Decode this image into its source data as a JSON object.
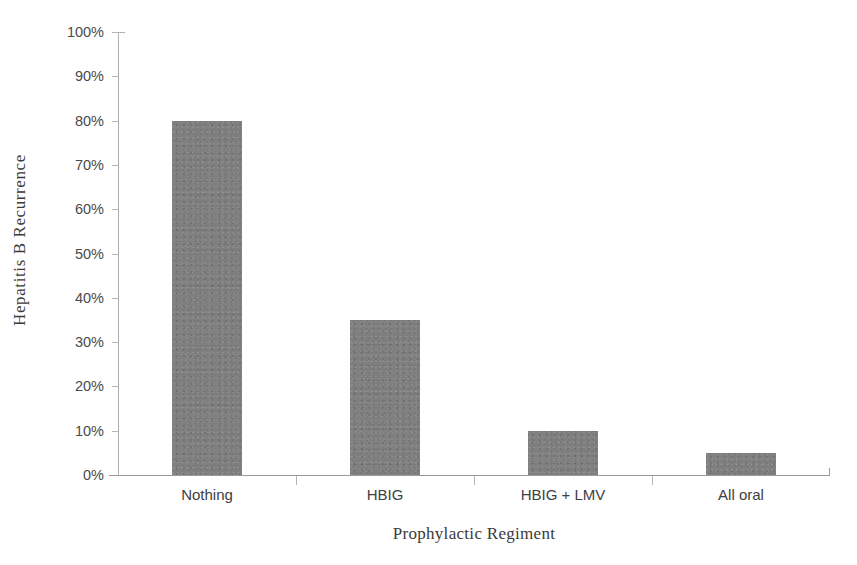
{
  "chart_data": {
    "type": "bar",
    "title": "",
    "xlabel": "Prophylactic Regiment",
    "ylabel": "Hepatitis B Recurrence",
    "categories": [
      "Nothing",
      "HBIG",
      "HBIG + LMV",
      "All oral"
    ],
    "values": [
      80,
      35,
      10,
      5
    ],
    "value_labels": [
      "80%",
      "35%",
      "10%",
      "5%"
    ],
    "ylim": [
      0,
      100
    ],
    "ytick_values": [
      0,
      10,
      20,
      30,
      40,
      50,
      60,
      70,
      80,
      90,
      100
    ],
    "ytick_labels": [
      "0%",
      "10%",
      "20%",
      "30%",
      "40%",
      "50%",
      "60%",
      "70%",
      "80%",
      "90%",
      "100%"
    ],
    "grid": false,
    "legend": false,
    "legend_position": "none",
    "series_color": "#7f7f7f",
    "background_color": "#ffffff",
    "axis_color": "#9a9a9a"
  },
  "axis": {
    "y_title": "Hepatitis B Recurrence",
    "x_title": "Prophylactic Regiment"
  },
  "yticks": [
    {
      "label": "100%",
      "value": 100
    },
    {
      "label": "90%",
      "value": 90
    },
    {
      "label": "80%",
      "value": 80
    },
    {
      "label": "70%",
      "value": 70
    },
    {
      "label": "60%",
      "value": 60
    },
    {
      "label": "50%",
      "value": 50
    },
    {
      "label": "40%",
      "value": 40
    },
    {
      "label": "30%",
      "value": 30
    },
    {
      "label": "20%",
      "value": 20
    },
    {
      "label": "10%",
      "value": 10
    },
    {
      "label": "0%",
      "value": 0
    }
  ],
  "bars": [
    {
      "category": "Nothing",
      "value": 80
    },
    {
      "category": "HBIG",
      "value": 35
    },
    {
      "category": "HBIG + LMV",
      "value": 10
    },
    {
      "category": "All oral",
      "value": 5
    }
  ]
}
